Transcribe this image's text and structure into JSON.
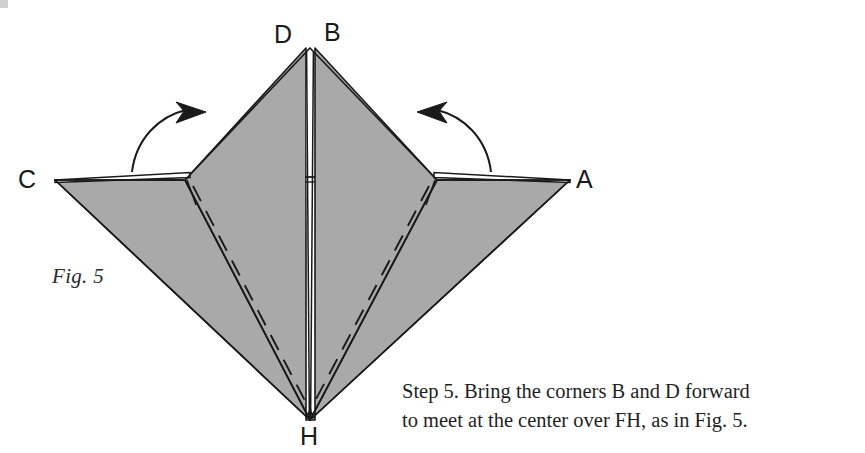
{
  "figure": {
    "fig_label": "Fig. 5",
    "vertex_labels": {
      "a": "A",
      "b": "B",
      "c": "C",
      "d": "D",
      "h": "H"
    },
    "colors": {
      "paper_fill": "#a9a9a9",
      "paper_fill_light": "#b4b4b4",
      "line": "#1a1a1a",
      "background": "#ffffff",
      "label": "#1a1a1a"
    },
    "arrows": {
      "left_arrow_name": "fold-left-flap-arrow",
      "right_arrow_name": "fold-right-flap-arrow"
    }
  },
  "caption": {
    "line1": "Step 5. Bring the corners B and D forward",
    "line2": "to meet at the center over FH, as in Fig. 5."
  }
}
